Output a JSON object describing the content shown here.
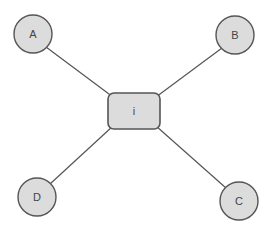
{
  "diagram": {
    "center": {
      "label": "i",
      "x": 134,
      "y": 111,
      "w": 52,
      "h": 36
    },
    "nodes": [
      {
        "id": "A",
        "label": "A",
        "x": 33,
        "y": 34
      },
      {
        "id": "B",
        "label": "B",
        "x": 235,
        "y": 35
      },
      {
        "id": "C",
        "label": "C",
        "x": 239,
        "y": 201
      },
      {
        "id": "D",
        "label": "D",
        "x": 37,
        "y": 197
      }
    ],
    "edges": [
      {
        "from": "i",
        "to": "A"
      },
      {
        "from": "i",
        "to": "B"
      },
      {
        "from": "i",
        "to": "C"
      },
      {
        "from": "i",
        "to": "D"
      }
    ],
    "colors": {
      "fill": "#dcdcdc",
      "stroke": "#555555",
      "edge": "#555555"
    }
  }
}
